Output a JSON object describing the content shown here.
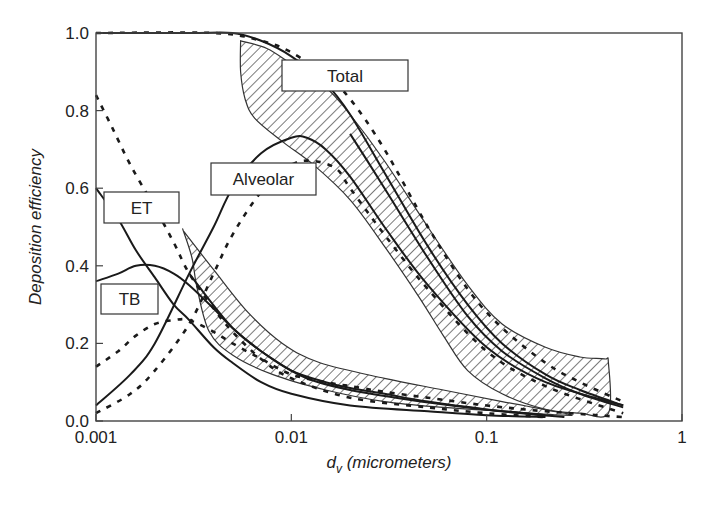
{
  "chart_data": {
    "type": "line",
    "title": "",
    "xlabel": "d_v (micrometers)",
    "xlabel_main": "d",
    "xlabel_sub": "v",
    "xlabel_rest": " (micrometers)",
    "ylabel": "Deposition efficiency",
    "xscale": "log",
    "xlim": [
      0.001,
      1
    ],
    "ylim": [
      0.0,
      1.0
    ],
    "grid": false,
    "legend": "inline labelled boxes",
    "x_ticks": [
      {
        "value": 0.001,
        "label": "0.001"
      },
      {
        "value": 0.01,
        "label": "0.01"
      },
      {
        "value": 0.1,
        "label": "0.1"
      },
      {
        "value": 1,
        "label": "1"
      }
    ],
    "y_ticks": [
      {
        "value": 0.0,
        "label": "0.0"
      },
      {
        "value": 0.2,
        "label": "0.2"
      },
      {
        "value": 0.4,
        "label": "0.4"
      },
      {
        "value": 0.6,
        "label": "0.6"
      },
      {
        "value": 0.8,
        "label": "0.8"
      },
      {
        "value": 1.0,
        "label": "1.0"
      }
    ],
    "labels": [
      {
        "text": "Total",
        "box": [
          282,
          60,
          126,
          31
        ]
      },
      {
        "text": "Alveolar",
        "box": [
          211,
          163,
          105,
          32
        ]
      },
      {
        "text": "ET",
        "box": [
          104,
          192,
          75,
          31
        ]
      },
      {
        "text": "TB",
        "box": [
          101,
          284,
          57,
          30
        ]
      }
    ],
    "bands": [
      {
        "name": "Total range",
        "upper": [
          [
            0.0055,
            0.98
          ],
          [
            0.0075,
            0.96
          ],
          [
            0.01,
            0.92
          ],
          [
            0.015,
            0.86
          ],
          [
            0.02,
            0.79
          ],
          [
            0.03,
            0.67
          ],
          [
            0.05,
            0.5
          ],
          [
            0.08,
            0.35
          ],
          [
            0.12,
            0.25
          ],
          [
            0.2,
            0.19
          ],
          [
            0.3,
            0.165
          ],
          [
            0.4,
            0.16
          ],
          [
            0.42,
            0.15
          ]
        ],
        "lower": [
          [
            0.42,
            0.02
          ],
          [
            0.3,
            0.02
          ],
          [
            0.2,
            0.03
          ],
          [
            0.12,
            0.07
          ],
          [
            0.08,
            0.13
          ],
          [
            0.06,
            0.22
          ],
          [
            0.045,
            0.32
          ],
          [
            0.03,
            0.45
          ],
          [
            0.02,
            0.57
          ],
          [
            0.013,
            0.66
          ],
          [
            0.009,
            0.72
          ],
          [
            0.0065,
            0.78
          ],
          [
            0.0058,
            0.83
          ],
          [
            0.0055,
            0.9
          ]
        ]
      },
      {
        "name": "TB range",
        "upper": [
          [
            0.0028,
            0.49
          ],
          [
            0.004,
            0.39
          ],
          [
            0.006,
            0.28
          ],
          [
            0.009,
            0.2
          ],
          [
            0.014,
            0.15
          ],
          [
            0.03,
            0.11
          ],
          [
            0.06,
            0.08
          ],
          [
            0.12,
            0.05
          ],
          [
            0.25,
            0.02
          ]
        ],
        "lower": [
          [
            0.25,
            0.015
          ],
          [
            0.12,
            0.025
          ],
          [
            0.06,
            0.035
          ],
          [
            0.03,
            0.05
          ],
          [
            0.015,
            0.08
          ],
          [
            0.008,
            0.12
          ],
          [
            0.005,
            0.17
          ],
          [
            0.0038,
            0.23
          ],
          [
            0.0033,
            0.34
          ],
          [
            0.0031,
            0.42
          ],
          [
            0.0028,
            0.49
          ]
        ]
      }
    ],
    "series": [
      {
        "name": "Total (solid)",
        "style": "solid",
        "x": [
          0.001,
          0.003,
          0.005,
          0.007,
          0.01,
          0.015,
          0.02,
          0.03,
          0.05,
          0.08,
          0.12,
          0.2,
          0.3,
          0.5
        ],
        "y": [
          1.0,
          1.0,
          1.0,
          0.98,
          0.94,
          0.87,
          0.79,
          0.64,
          0.45,
          0.3,
          0.2,
          0.12,
          0.08,
          0.04
        ]
      },
      {
        "name": "Total (dashed)",
        "style": "dashed",
        "x": [
          0.001,
          0.004,
          0.007,
          0.01,
          0.015,
          0.02,
          0.03,
          0.05,
          0.08,
          0.12,
          0.2,
          0.3,
          0.5
        ],
        "y": [
          1.0,
          1.0,
          0.98,
          0.95,
          0.89,
          0.83,
          0.7,
          0.5,
          0.34,
          0.24,
          0.15,
          0.1,
          0.05
        ]
      },
      {
        "name": "Total (solid, lower)",
        "style": "solid",
        "x": [
          0.02,
          0.03,
          0.05,
          0.08,
          0.12,
          0.2,
          0.3,
          0.5
        ],
        "y": [
          0.74,
          0.6,
          0.42,
          0.27,
          0.18,
          0.11,
          0.07,
          0.035
        ]
      },
      {
        "name": "Alveolar (solid)",
        "style": "solid",
        "x": [
          0.001,
          0.0015,
          0.002,
          0.003,
          0.004,
          0.005,
          0.007,
          0.01,
          0.012,
          0.015,
          0.02,
          0.03,
          0.05,
          0.1,
          0.2,
          0.5
        ],
        "y": [
          0.04,
          0.12,
          0.2,
          0.38,
          0.5,
          0.6,
          0.69,
          0.73,
          0.73,
          0.7,
          0.63,
          0.5,
          0.35,
          0.19,
          0.1,
          0.04
        ]
      },
      {
        "name": "Alveolar (dashed)",
        "style": "dashed",
        "x": [
          0.001,
          0.0015,
          0.002,
          0.003,
          0.004,
          0.005,
          0.007,
          0.01,
          0.013,
          0.017,
          0.02,
          0.03,
          0.05,
          0.1,
          0.2,
          0.5
        ],
        "y": [
          0.02,
          0.07,
          0.13,
          0.25,
          0.38,
          0.48,
          0.59,
          0.66,
          0.67,
          0.65,
          0.6,
          0.48,
          0.34,
          0.18,
          0.09,
          0.02
        ]
      },
      {
        "name": "ET (solid)",
        "style": "solid",
        "x": [
          0.001,
          0.0013,
          0.0016,
          0.002,
          0.0025,
          0.003,
          0.004,
          0.005,
          0.007,
          0.01,
          0.02,
          0.05,
          0.1,
          0.2
        ],
        "y": [
          0.6,
          0.52,
          0.44,
          0.37,
          0.3,
          0.26,
          0.19,
          0.15,
          0.1,
          0.07,
          0.04,
          0.025,
          0.015,
          0.01
        ]
      },
      {
        "name": "ET (dashed)",
        "style": "dashed",
        "x": [
          0.001,
          0.0012,
          0.0015,
          0.002,
          0.0025,
          0.003,
          0.004,
          0.005,
          0.007,
          0.01,
          0.02,
          0.05,
          0.1,
          0.2
        ],
        "y": [
          0.84,
          0.76,
          0.66,
          0.55,
          0.46,
          0.38,
          0.29,
          0.23,
          0.16,
          0.11,
          0.06,
          0.035,
          0.02,
          0.01
        ]
      },
      {
        "name": "TB (solid)",
        "style": "solid",
        "x": [
          0.001,
          0.0013,
          0.0016,
          0.002,
          0.0025,
          0.003,
          0.004,
          0.005,
          0.007,
          0.01,
          0.015,
          0.02,
          0.03,
          0.05,
          0.1,
          0.2
        ],
        "y": [
          0.36,
          0.38,
          0.4,
          0.4,
          0.38,
          0.35,
          0.29,
          0.24,
          0.18,
          0.13,
          0.1,
          0.085,
          0.07,
          0.05,
          0.03,
          0.015
        ]
      },
      {
        "name": "TB (dashed)",
        "style": "dashed",
        "x": [
          0.001,
          0.0013,
          0.0016,
          0.002,
          0.0025,
          0.003,
          0.004,
          0.005,
          0.007,
          0.01,
          0.015,
          0.02,
          0.03,
          0.05,
          0.1,
          0.2,
          0.5
        ],
        "y": [
          0.14,
          0.18,
          0.22,
          0.25,
          0.26,
          0.26,
          0.23,
          0.2,
          0.16,
          0.12,
          0.1,
          0.09,
          0.075,
          0.06,
          0.04,
          0.025,
          0.01
        ]
      },
      {
        "name": "TB (solid, lower)",
        "style": "solid",
        "x": [
          0.003,
          0.005,
          0.008,
          0.012,
          0.02,
          0.04,
          0.08,
          0.15,
          0.25
        ],
        "y": [
          0.38,
          0.24,
          0.16,
          0.11,
          0.08,
          0.055,
          0.035,
          0.02,
          0.01
        ]
      }
    ]
  }
}
